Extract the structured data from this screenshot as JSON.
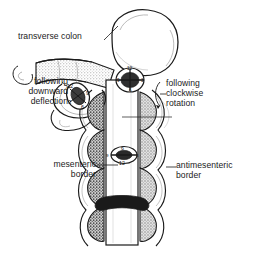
{
  "figure": {
    "background_color": "#ffffff",
    "ink_color": "#1a1a1a",
    "shade_color": "#9a9a9a"
  },
  "labels": {
    "transverse_colon": "transverse colon",
    "downward_deflection": "following\ndownward\ndeflection",
    "clockwise_rotation": "following\nclockwise\nrotation",
    "mesenteric_border": "mesenteric\nborder",
    "antimesenteric_border": "antimesenteric\nborder"
  },
  "clock_faces": [
    {
      "name": "upper-left-clock",
      "orientation": "tilted",
      "marks": {
        "twelve": "12",
        "three": "3",
        "six": "6",
        "nine": "9"
      }
    },
    {
      "name": "upper-right-clock",
      "orientation": "frontal",
      "marks": {
        "twelve": "12",
        "three": "3",
        "six": "6",
        "nine": "9"
      }
    },
    {
      "name": "lower-clock",
      "orientation": "inverted",
      "marks": {
        "six": "6",
        "twelve": "12",
        "three": "3",
        "nine": "9"
      }
    }
  ]
}
